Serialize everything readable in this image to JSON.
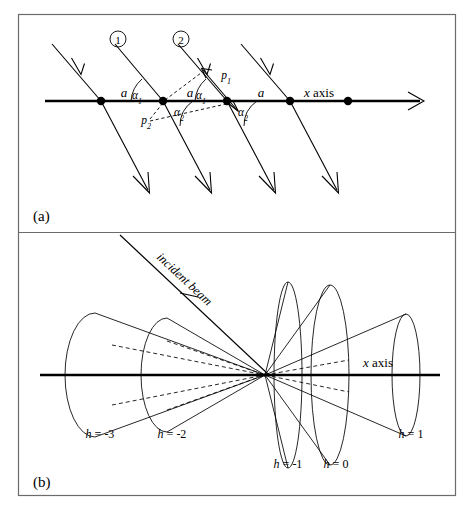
{
  "figure": {
    "panels": [
      {
        "id": "a",
        "caption": "(a)",
        "axis_label": "x axis",
        "spacing_labels": [
          "a",
          "a",
          "a"
        ],
        "angle_labels_upper": [
          "α1",
          "α1"
        ],
        "angle_labels_lower": [
          "α2",
          "α2"
        ],
        "path_difference_labels": [
          "p1",
          "p2"
        ],
        "ray_numbers": [
          "①",
          "②"
        ],
        "lattice_point_count": 5
      },
      {
        "id": "b",
        "caption": "(b)",
        "axis_label": "x axis",
        "beam_label": "incident beam",
        "cone_labels": [
          "h = -3",
          "h = -2",
          "h = -1",
          "h = 0",
          "h = 1"
        ],
        "cone_orders": [
          -3,
          -2,
          -1,
          0,
          1
        ]
      }
    ],
    "colors": {
      "ink": "#000000",
      "frame": "#6b6b6b",
      "background": "#ffffff"
    }
  }
}
